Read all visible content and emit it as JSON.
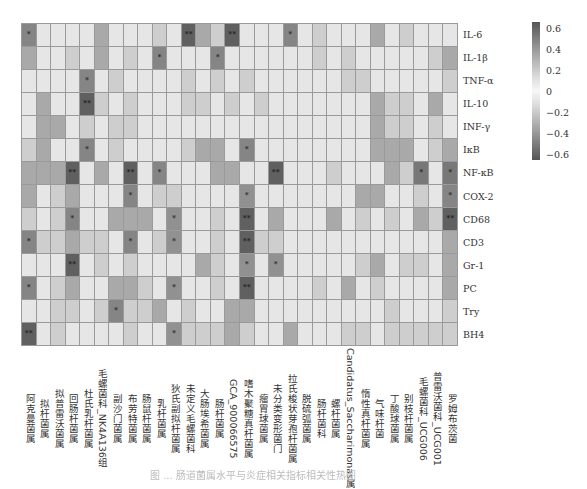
{
  "chart_data": {
    "type": "heatmap",
    "title": "",
    "caption": "图 ... 肠道菌属水平与炎症相关指标相关性热图",
    "rows": [
      "IL-6",
      "IL-1β",
      "TNF-α",
      "IL-10",
      "INF-γ",
      "IκB",
      "NF-κB",
      "COX-2",
      "CD68",
      "CD3",
      "Gr-1",
      "PC",
      "Try",
      "BH4"
    ],
    "columns": [
      "阿克曼菌属",
      "拟杆菌属",
      "拟普雷沃菌属",
      "回肠杆菌属",
      "杜氏乳杆菌属",
      "毛螺菌科_NK4A136组",
      "副沙门菌属",
      "布劳特菌属",
      "肠鼠杆菌属",
      "乳杆菌属",
      "狄氏副拟杆菌属",
      "未定义毛螺菌科",
      "大肠埃希菌属",
      "肠杆菌属",
      "GCA_900066575",
      "嗜木聚糖真杆菌属",
      "瘤胃球菌属",
      "未分类变形菌门",
      "拉氏梭状芽孢杆菌属",
      "脱硫弧菌属",
      "肠杆菌科",
      "螺杆菌属",
      "Candidatus_Saccharimonas属",
      "惰性真杆菌属",
      "气味杆菌",
      "丁酸球菌属",
      "别枝杆菌属",
      "毛螺菌科_UCG006",
      "普雷沃菌科_UCG001",
      "罗姆布茨菌"
    ],
    "values": [
      [
        0.45,
        0.05,
        0.05,
        0.05,
        0.05,
        0.3,
        0.05,
        0.05,
        0.05,
        0.15,
        0.05,
        0.6,
        0.3,
        0.15,
        0.6,
        0.05,
        0.05,
        0.05,
        0.45,
        0.05,
        0.15,
        0.05,
        0.05,
        0.05,
        0.3,
        0.05,
        0.15,
        0.05,
        0.05,
        0.05
      ],
      [
        0.3,
        0.05,
        0.05,
        0.15,
        0.05,
        0.3,
        0.05,
        0.15,
        0.05,
        0.45,
        0.05,
        0.05,
        0.05,
        0.45,
        0.05,
        0.05,
        0.05,
        0.05,
        0.05,
        0.05,
        0.15,
        0.05,
        0.15,
        0.05,
        0.05,
        0.05,
        0.05,
        0.05,
        0.15,
        0.3
      ],
      [
        -0.05,
        -0.05,
        -0.05,
        -0.05,
        -0.45,
        -0.05,
        -0.15,
        -0.05,
        -0.05,
        -0.05,
        -0.05,
        -0.15,
        -0.05,
        -0.15,
        -0.05,
        -0.15,
        -0.05,
        -0.05,
        -0.05,
        -0.05,
        -0.05,
        -0.05,
        -0.15,
        -0.15,
        -0.05,
        -0.05,
        -0.05,
        -0.05,
        -0.05,
        -0.15
      ],
      [
        -0.05,
        -0.3,
        -0.05,
        -0.05,
        -0.6,
        -0.15,
        -0.05,
        -0.15,
        -0.05,
        -0.05,
        -0.05,
        -0.15,
        -0.15,
        -0.05,
        -0.15,
        -0.05,
        -0.15,
        -0.05,
        -0.05,
        -0.05,
        -0.05,
        -0.05,
        -0.05,
        -0.05,
        -0.3,
        -0.15,
        -0.15,
        -0.05,
        -0.3,
        -0.05
      ],
      [
        -0.05,
        -0.3,
        -0.3,
        -0.05,
        -0.15,
        -0.05,
        -0.15,
        -0.15,
        -0.05,
        -0.05,
        -0.05,
        -0.05,
        -0.05,
        -0.05,
        -0.05,
        -0.05,
        -0.05,
        -0.05,
        -0.05,
        -0.05,
        -0.05,
        -0.05,
        -0.05,
        -0.05,
        -0.3,
        -0.15,
        -0.15,
        -0.05,
        -0.15,
        -0.05
      ],
      [
        -0.15,
        -0.3,
        -0.05,
        -0.05,
        -0.45,
        -0.05,
        -0.15,
        -0.05,
        -0.05,
        -0.05,
        -0.05,
        -0.15,
        -0.3,
        -0.3,
        -0.05,
        -0.45,
        -0.05,
        -0.05,
        -0.05,
        -0.05,
        -0.05,
        -0.05,
        -0.05,
        -0.05,
        -0.3,
        -0.3,
        -0.3,
        -0.05,
        -0.15,
        -0.3
      ],
      [
        -0.3,
        -0.3,
        -0.3,
        -0.6,
        -0.05,
        -0.3,
        -0.05,
        -0.6,
        -0.05,
        -0.45,
        -0.05,
        -0.05,
        -0.05,
        -0.3,
        -0.3,
        -0.05,
        -0.05,
        -0.6,
        -0.05,
        -0.05,
        -0.05,
        -0.15,
        -0.05,
        -0.05,
        -0.05,
        -0.3,
        -0.15,
        -0.5,
        -0.05,
        -0.5
      ],
      [
        -0.3,
        -0.05,
        -0.15,
        -0.3,
        -0.05,
        -0.05,
        -0.05,
        -0.45,
        -0.05,
        -0.15,
        -0.15,
        -0.05,
        -0.05,
        -0.05,
        -0.05,
        -0.4,
        -0.05,
        -0.05,
        -0.05,
        -0.05,
        -0.05,
        -0.05,
        -0.05,
        -0.3,
        -0.3,
        -0.05,
        -0.05,
        -0.15,
        -0.05,
        -0.45
      ],
      [
        -0.15,
        -0.05,
        -0.15,
        -0.45,
        -0.05,
        -0.05,
        -0.3,
        -0.3,
        -0.3,
        -0.05,
        -0.4,
        -0.05,
        -0.05,
        -0.15,
        -0.05,
        -0.6,
        -0.05,
        -0.3,
        -0.05,
        -0.05,
        -0.05,
        -0.3,
        -0.05,
        -0.15,
        -0.05,
        -0.15,
        -0.05,
        -0.3,
        -0.15,
        -0.6
      ],
      [
        -0.45,
        -0.15,
        -0.15,
        -0.3,
        -0.15,
        -0.15,
        -0.05,
        -0.45,
        -0.05,
        -0.15,
        -0.4,
        -0.05,
        -0.05,
        -0.15,
        -0.05,
        -0.6,
        -0.15,
        -0.15,
        -0.05,
        -0.05,
        -0.05,
        -0.05,
        -0.05,
        -0.05,
        -0.05,
        -0.05,
        -0.05,
        -0.05,
        -0.05,
        -0.3
      ],
      [
        -0.05,
        -0.05,
        -0.05,
        -0.6,
        -0.05,
        -0.15,
        -0.05,
        -0.15,
        -0.05,
        -0.05,
        -0.05,
        -0.05,
        -0.3,
        -0.15,
        -0.05,
        -0.4,
        -0.05,
        -0.4,
        -0.05,
        -0.05,
        -0.05,
        -0.05,
        -0.05,
        -0.15,
        -0.3,
        -0.05,
        -0.15,
        -0.15,
        -0.05,
        -0.3
      ],
      [
        -0.45,
        -0.05,
        -0.15,
        -0.3,
        -0.05,
        -0.05,
        -0.3,
        -0.3,
        -0.15,
        -0.05,
        -0.4,
        -0.05,
        -0.05,
        -0.15,
        -0.05,
        -0.6,
        -0.05,
        -0.05,
        -0.05,
        -0.05,
        -0.15,
        -0.05,
        -0.3,
        -0.05,
        -0.15,
        -0.05,
        -0.05,
        -0.05,
        -0.05,
        -0.3
      ],
      [
        -0.05,
        -0.05,
        -0.15,
        -0.15,
        -0.05,
        -0.15,
        -0.45,
        -0.15,
        -0.15,
        -0.3,
        -0.05,
        -0.15,
        -0.05,
        -0.05,
        -0.3,
        -0.3,
        -0.05,
        -0.05,
        -0.05,
        -0.05,
        -0.05,
        -0.05,
        -0.05,
        -0.05,
        -0.05,
        -0.15,
        -0.05,
        -0.05,
        -0.05,
        -0.15
      ],
      [
        -0.6,
        -0.05,
        -0.15,
        -0.05,
        -0.05,
        -0.05,
        -0.05,
        -0.15,
        -0.05,
        -0.05,
        -0.4,
        -0.15,
        -0.15,
        -0.15,
        -0.3,
        -0.15,
        -0.05,
        -0.05,
        -0.3,
        -0.05,
        -0.05,
        -0.05,
        -0.15,
        -0.15,
        -0.05,
        -0.15,
        -0.15,
        -0.15,
        -0.15,
        -0.15
      ]
    ],
    "significance": [
      [
        "*",
        "",
        "",
        "",
        "",
        "",
        "",
        "",
        "",
        "",
        "",
        "**",
        "",
        "",
        "**",
        "",
        "",
        "",
        "*",
        "",
        "",
        "",
        "",
        "",
        "",
        "",
        "",
        "",
        "",
        ""
      ],
      [
        "",
        "",
        "",
        "",
        "",
        "",
        "",
        "",
        "",
        "*",
        "",
        "",
        "",
        "*",
        "",
        "",
        "",
        "",
        "",
        "",
        "",
        "",
        "",
        "",
        "",
        "",
        "",
        "",
        "",
        ""
      ],
      [
        "",
        "",
        "",
        "",
        "*",
        "",
        "",
        "",
        "",
        "",
        "",
        "",
        "",
        "",
        "",
        "",
        "",
        "",
        "",
        "",
        "",
        "",
        "",
        "",
        "",
        "",
        "",
        "",
        "",
        ""
      ],
      [
        "",
        "",
        "",
        "",
        "**",
        "",
        "",
        "",
        "",
        "",
        "",
        "",
        "",
        "",
        "",
        "",
        "",
        "",
        "",
        "",
        "",
        "",
        "",
        "",
        "",
        "",
        "",
        "",
        "",
        ""
      ],
      [
        "",
        "",
        "",
        "",
        "",
        "",
        "",
        "",
        "",
        "",
        "",
        "",
        "",
        "",
        "",
        "",
        "",
        "",
        "",
        "",
        "",
        "",
        "",
        "",
        "",
        "",
        "",
        "",
        "",
        ""
      ],
      [
        "",
        "",
        "",
        "",
        "*",
        "",
        "",
        "",
        "",
        "",
        "",
        "",
        "",
        "",
        "",
        "*",
        "",
        "",
        "",
        "",
        "",
        "",
        "",
        "",
        "",
        "",
        "",
        "",
        "",
        ""
      ],
      [
        "",
        "",
        "",
        "**",
        "",
        "",
        "",
        "**",
        "",
        "*",
        "",
        "",
        "",
        "",
        "",
        "",
        "",
        "**",
        "",
        "",
        "",
        "",
        "",
        "",
        "",
        "",
        "",
        "*",
        "",
        "*"
      ],
      [
        "",
        "",
        "",
        "",
        "",
        "",
        "",
        "*",
        "",
        "",
        "",
        "",
        "",
        "",
        "",
        "*",
        "",
        "",
        "",
        "",
        "",
        "",
        "",
        "",
        "",
        "",
        "",
        "",
        "",
        "*"
      ],
      [
        "",
        "",
        "",
        "*",
        "",
        "",
        "",
        "",
        "",
        "",
        "*",
        "",
        "",
        "",
        "",
        "**",
        "",
        "",
        "",
        "",
        "",
        "",
        "",
        "",
        "",
        "",
        "",
        "",
        "",
        "**"
      ],
      [
        "*",
        "",
        "",
        "",
        "",
        "",
        "",
        "*",
        "",
        "",
        "*",
        "",
        "",
        "",
        "",
        "**",
        "",
        "",
        "",
        "",
        "",
        "",
        "",
        "",
        "",
        "",
        "",
        "",
        "",
        ""
      ],
      [
        "",
        "",
        "",
        "**",
        "",
        "",
        "",
        "",
        "",
        "",
        "",
        "",
        "",
        "",
        "",
        "*",
        "",
        "*",
        "",
        "",
        "",
        "",
        "",
        "",
        "",
        "",
        "",
        "",
        "",
        ""
      ],
      [
        "*",
        "",
        "",
        "",
        "",
        "",
        "",
        "",
        "",
        "",
        "*",
        "",
        "",
        "",
        "",
        "**",
        "",
        "",
        "",
        "",
        "",
        "",
        "",
        "",
        "",
        "",
        "",
        "",
        "",
        ""
      ],
      [
        "",
        "",
        "",
        "",
        "",
        "",
        "*",
        "",
        "",
        "",
        "",
        "",
        "",
        "",
        "",
        "",
        "",
        "",
        "",
        "",
        "",
        "",
        "",
        "",
        "",
        "",
        "",
        "",
        "",
        ""
      ],
      [
        "**",
        "",
        "",
        "",
        "",
        "",
        "",
        "",
        "",
        "",
        "*",
        "",
        "",
        "",
        "",
        "",
        "",
        "",
        "",
        "",
        "",
        "",
        "",
        "",
        "",
        "",
        "",
        "",
        "",
        ""
      ]
    ],
    "colorbar": {
      "ticks": [
        "0.6",
        "0.4",
        "0.2",
        "0",
        "−0.2",
        "−0.4",
        "−0.6"
      ],
      "range": [
        -0.65,
        0.65
      ],
      "colors": {
        "extreme": "#555555",
        "mid": "#9a9a9a",
        "zero": "#f7f7f7"
      }
    },
    "grid": true,
    "legend_position": "right"
  }
}
